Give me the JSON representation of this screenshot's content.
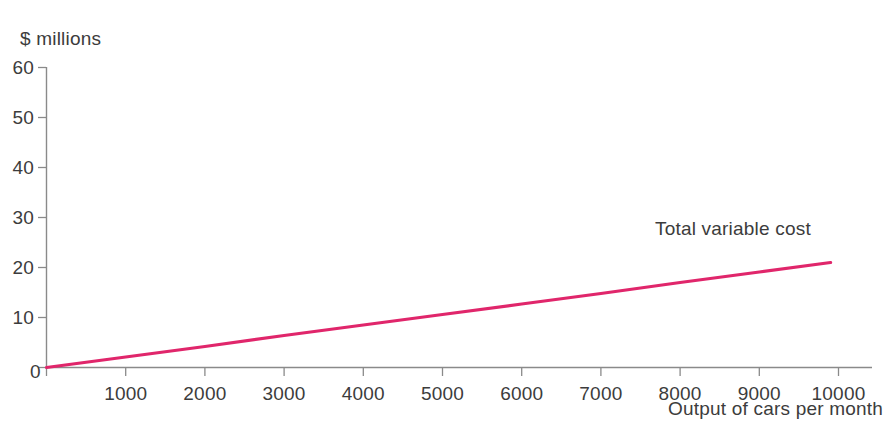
{
  "chart_data": {
    "type": "line",
    "title": "",
    "subtitle": "",
    "ylabel": "$ millions",
    "xlabel": "Output of cars per month",
    "xlim": [
      0,
      10000
    ],
    "ylim": [
      0,
      60
    ],
    "grid": false,
    "legend_position": "inline-annotation",
    "x_ticks": [
      0,
      1000,
      2000,
      3000,
      4000,
      5000,
      6000,
      7000,
      8000,
      9000,
      10000
    ],
    "x_tick_labels": [
      "0",
      "1000",
      "2000",
      "3000",
      "4000",
      "5000",
      "6000",
      "7000",
      "8000",
      "9000",
      "10000"
    ],
    "y_ticks": [
      0,
      10,
      20,
      30,
      40,
      50,
      60
    ],
    "y_tick_labels": [
      "0",
      "10",
      "20",
      "30",
      "40",
      "50",
      "60"
    ],
    "series": [
      {
        "name": "Total variable cost",
        "color": "#E0266B",
        "x": [
          0,
          1000,
          2000,
          3000,
          4000,
          5000,
          6000,
          7000,
          8000,
          9000,
          9900
        ],
        "values": [
          0,
          2.1,
          4.2,
          6.4,
          8.5,
          10.6,
          12.7,
          14.8,
          17.0,
          19.1,
          21.0
        ]
      }
    ],
    "annotations": [
      {
        "text": "Total variable cost",
        "x": 7200,
        "y": 24.5
      }
    ]
  },
  "axis": {
    "y_title": "$ millions",
    "x_title": "Output of cars per month",
    "origin_label": "0",
    "axis_color": "#8a8a8a"
  },
  "series_label": {
    "total_variable_cost": "Total variable cost"
  },
  "y_labels": {
    "t60": "60",
    "t50": "50",
    "t40": "40",
    "t30": "30",
    "t20": "20",
    "t10": "10"
  },
  "x_labels": {
    "t1000": "1000",
    "t2000": "2000",
    "t3000": "3000",
    "t4000": "4000",
    "t5000": "5000",
    "t6000": "6000",
    "t7000": "7000",
    "t8000": "8000",
    "t9000": "9000",
    "t10000": "10000"
  }
}
